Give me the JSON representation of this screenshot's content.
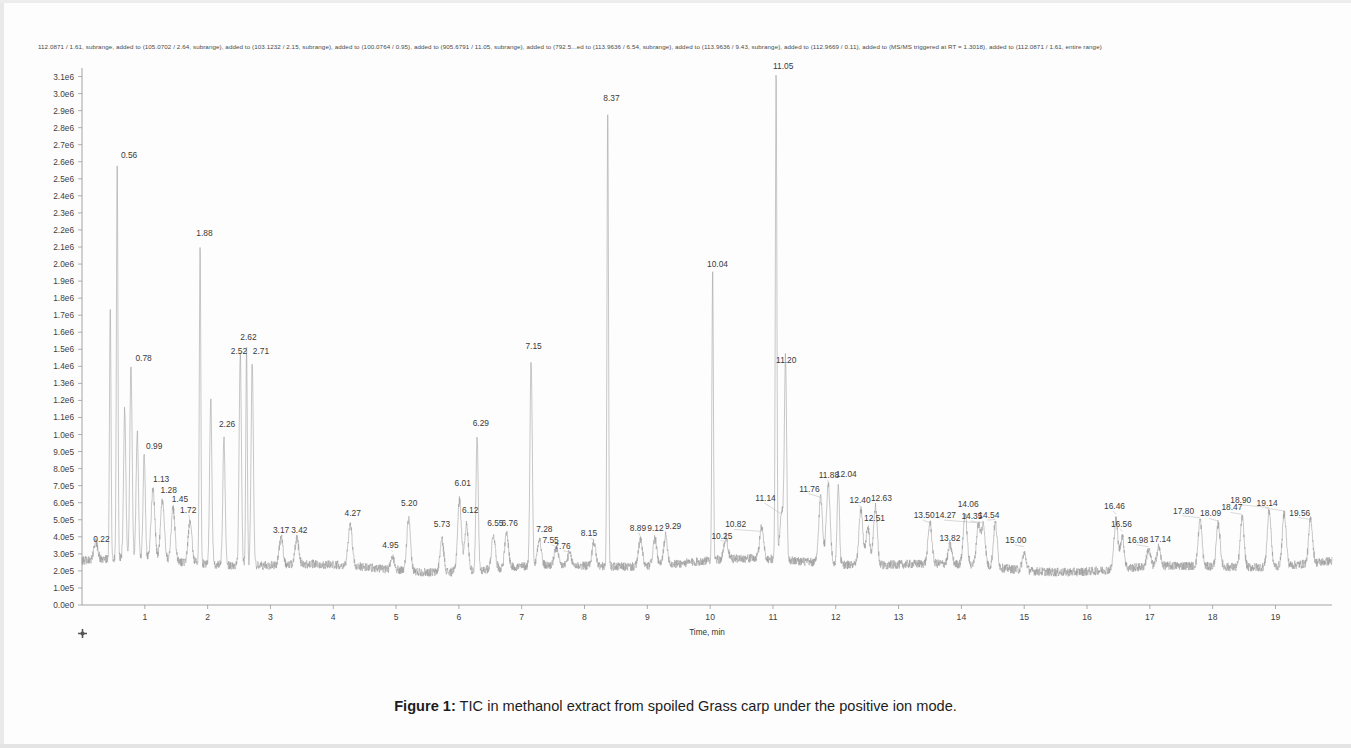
{
  "figure": {
    "header_text": "112.0871 / 1.61, subrange, added to (105.0702 / 2.64, subrange), added to (103.1232 / 2.15, subrange), added to (100.0764 / 0.95), added to (905.6791 / 11.05, subrange), added to (792.5...ed to (113.9636 / 6.54, subrange), added to (113.9636 / 9.43, subrange), added to (112.9669 / 0.11), added to (MS/MS triggered at RT = 1.3018), added to (112.0871 / 1.61, entire range)",
    "caption_label": "Figure 1:",
    "caption_text": " TIC in methanol extract from spoiled Grass carp under the positive ion mode.",
    "trace_color": "#9b9b9b",
    "axis_color": "#9a9a9a",
    "text_color": "#3a3a3a"
  },
  "chart_data": {
    "type": "line",
    "title": "TIC in methanol extract from spoiled Grass carp under the positive ion mode.",
    "xlabel": "Time, min",
    "ylabel": "Intensity",
    "xlim": [
      0.0,
      19.9
    ],
    "ylim": [
      0.0,
      3150000
    ],
    "grid": false,
    "legend": null,
    "xticks": [
      1,
      2,
      3,
      4,
      5,
      6,
      7,
      8,
      9,
      10,
      11,
      12,
      13,
      14,
      15,
      16,
      17,
      18,
      19
    ],
    "xtick_labels": [
      "1",
      "2",
      "3",
      "4",
      "5",
      "6",
      "7",
      "8",
      "9",
      "10",
      "11",
      "12",
      "13",
      "14",
      "15",
      "16",
      "17",
      "18",
      "19"
    ],
    "yticks": [
      0,
      100000,
      200000,
      300000,
      400000,
      500000,
      600000,
      700000,
      800000,
      900000,
      1000000,
      1100000,
      1200000,
      1300000,
      1400000,
      1500000,
      1600000,
      1700000,
      1800000,
      1900000,
      2000000,
      2100000,
      2200000,
      2300000,
      2400000,
      2500000,
      2600000,
      2700000,
      2800000,
      2900000,
      3000000,
      3100000
    ],
    "ytick_labels": [
      "0.0e0",
      "1.0e5",
      "2.0e5",
      "3.0e5",
      "4.0e5",
      "5.0e5",
      "6.0e5",
      "7.0e5",
      "8.0e5",
      "9.0e5",
      "1.0e6",
      "1.1e6",
      "1.2e6",
      "1.3e6",
      "1.4e6",
      "1.5e6",
      "1.6e6",
      "1.7e6",
      "1.8e6",
      "1.9e6",
      "2.0e6",
      "2.1e6",
      "2.2e6",
      "2.3e6",
      "2.4e6",
      "2.5e6",
      "2.6e6",
      "2.7e6",
      "2.8e6",
      "2.9e6",
      "3.0e6",
      "3.1e6"
    ],
    "baseline": 230000,
    "peaks": [
      {
        "rt": 0.22,
        "label": "0.22",
        "height": 330000,
        "label_x": 0.18,
        "label_y": 370000,
        "anchor": "start"
      },
      {
        "rt": 0.45,
        "label": null,
        "height": 1720000
      },
      {
        "rt": 0.56,
        "label": "0.56",
        "height": 2560000,
        "label_x": 0.62,
        "label_y": 2620000,
        "anchor": "start"
      },
      {
        "rt": 0.68,
        "label": null,
        "height": 1100000
      },
      {
        "rt": 0.78,
        "label": "0.78",
        "height": 1370000,
        "label_x": 0.85,
        "label_y": 1430000,
        "anchor": "start"
      },
      {
        "rt": 0.88,
        "label": null,
        "height": 980000
      },
      {
        "rt": 0.99,
        "label": "0.99",
        "height": 840000,
        "label_x": 1.02,
        "label_y": 915000,
        "anchor": "start"
      },
      {
        "rt": 1.13,
        "label": "1.13",
        "height": 640000,
        "label_x": 1.13,
        "label_y": 720000,
        "anchor": "start"
      },
      {
        "rt": 1.28,
        "label": "1.28",
        "height": 580000,
        "label_x": 1.25,
        "label_y": 655000,
        "anchor": "start"
      },
      {
        "rt": 1.45,
        "label": "1.45",
        "height": 540000,
        "label_x": 1.43,
        "label_y": 605000,
        "anchor": "start"
      },
      {
        "rt": 1.72,
        "label": "1.72",
        "height": 470000,
        "label_x": 1.56,
        "label_y": 540000,
        "anchor": "start"
      },
      {
        "rt": 1.88,
        "label": "1.88",
        "height": 2110000,
        "label_x": 1.82,
        "label_y": 2165000,
        "anchor": "start"
      },
      {
        "rt": 2.05,
        "label": null,
        "height": 1180000
      },
      {
        "rt": 2.26,
        "label": "2.26",
        "height": 980000,
        "label_x": 2.18,
        "label_y": 1045000,
        "anchor": "start"
      },
      {
        "rt": 2.52,
        "label": "2.52",
        "height": 1470000,
        "label_x": 2.37,
        "label_y": 1475000,
        "anchor": "start"
      },
      {
        "rt": 2.62,
        "label": "2.62",
        "height": 1530000,
        "label_x": 2.52,
        "label_y": 1555000,
        "anchor": "start"
      },
      {
        "rt": 2.71,
        "label": "2.71",
        "height": 1420000,
        "label_x": 2.72,
        "label_y": 1475000,
        "anchor": "start"
      },
      {
        "rt": 3.17,
        "label": "3.17",
        "height": 390000,
        "label_x": 3.04,
        "label_y": 420000,
        "anchor": "start"
      },
      {
        "rt": 3.42,
        "label": "3.42",
        "height": 380000,
        "label_x": 3.33,
        "label_y": 420000,
        "anchor": "start"
      },
      {
        "rt": 4.27,
        "label": "4.27",
        "height": 480000,
        "label_x": 4.18,
        "label_y": 520000,
        "anchor": "start"
      },
      {
        "rt": 4.95,
        "label": "4.95",
        "height": 300000,
        "label_x": 4.78,
        "label_y": 335000,
        "anchor": "start"
      },
      {
        "rt": 5.2,
        "label": "5.20",
        "height": 530000,
        "label_x": 5.08,
        "label_y": 580000,
        "anchor": "start"
      },
      {
        "rt": 5.73,
        "label": "5.73",
        "height": 420000,
        "label_x": 5.6,
        "label_y": 455000,
        "anchor": "start"
      },
      {
        "rt": 6.01,
        "label": "6.01",
        "height": 650000,
        "label_x": 5.93,
        "label_y": 700000,
        "anchor": "start"
      },
      {
        "rt": 6.12,
        "label": "6.12",
        "height": 500000,
        "label_x": 6.05,
        "label_y": 540000,
        "anchor": "start"
      },
      {
        "rt": 6.29,
        "label": "6.29",
        "height": 1000000,
        "label_x": 6.22,
        "label_y": 1050000,
        "anchor": "start"
      },
      {
        "rt": 6.55,
        "label": "6.55",
        "height": 430000,
        "label_x": 6.45,
        "label_y": 465000,
        "anchor": "start"
      },
      {
        "rt": 6.76,
        "label": "6.76",
        "height": 430000,
        "label_x": 6.68,
        "label_y": 465000,
        "anchor": "start"
      },
      {
        "rt": 7.15,
        "label": "7.15",
        "height": 1450000,
        "label_x": 7.06,
        "label_y": 1500000,
        "anchor": "start"
      },
      {
        "rt": 7.28,
        "label": "7.28",
        "height": 390000,
        "label_x": 7.23,
        "label_y": 430000,
        "anchor": "start"
      },
      {
        "rt": 7.55,
        "label": "7.55",
        "height": 330000,
        "label_x": 7.33,
        "label_y": 365000,
        "anchor": "start"
      },
      {
        "rt": 7.76,
        "label": "7.76",
        "height": 300000,
        "label_x": 7.52,
        "label_y": 330000,
        "anchor": "start"
      },
      {
        "rt": 8.15,
        "label": "8.15",
        "height": 370000,
        "label_x": 7.94,
        "label_y": 405000,
        "anchor": "start"
      },
      {
        "rt": 8.37,
        "label": "8.37",
        "height": 2900000,
        "label_x": 8.3,
        "label_y": 2955000,
        "anchor": "start"
      },
      {
        "rt": 8.89,
        "label": "8.89",
        "height": 390000,
        "label_x": 8.72,
        "label_y": 435000,
        "anchor": "start"
      },
      {
        "rt": 9.12,
        "label": "9.12",
        "height": 390000,
        "label_x": 9.0,
        "label_y": 435000,
        "anchor": "start"
      },
      {
        "rt": 9.29,
        "label": "9.29",
        "height": 400000,
        "label_x": 9.28,
        "label_y": 445000,
        "anchor": "start"
      },
      {
        "rt": 10.04,
        "label": "10.04",
        "height": 1930000,
        "label_x": 9.95,
        "label_y": 1980000,
        "anchor": "start"
      },
      {
        "rt": 10.25,
        "label": "10.25",
        "height": 360000,
        "label_x": 10.02,
        "label_y": 390000,
        "anchor": "start"
      },
      {
        "rt": 10.82,
        "label": "10.82",
        "height": 420000,
        "label_x": 10.24,
        "label_y": 455000,
        "anchor": "start"
      },
      {
        "rt": 11.05,
        "label": "11.05",
        "height": 3100000,
        "label_x": 11.0,
        "label_y": 3145000,
        "anchor": "start"
      },
      {
        "rt": 11.14,
        "label": "11.14",
        "height": 520000,
        "label_x": 10.72,
        "label_y": 610000,
        "anchor": "start"
      },
      {
        "rt": 11.2,
        "label": "11.20",
        "height": 1380000,
        "label_x": 11.05,
        "label_y": 1420000,
        "anchor": "start"
      },
      {
        "rt": 11.76,
        "label": "11.76",
        "height": 620000,
        "label_x": 11.42,
        "label_y": 665000,
        "anchor": "start"
      },
      {
        "rt": 11.88,
        "label": "11.88",
        "height": 700000,
        "label_x": 11.73,
        "label_y": 745000,
        "anchor": "start"
      },
      {
        "rt": 12.04,
        "label": "12.04",
        "height": 710000,
        "label_x": 12.0,
        "label_y": 750000,
        "anchor": "start"
      },
      {
        "rt": 12.4,
        "label": "12.40",
        "height": 560000,
        "label_x": 12.22,
        "label_y": 600000,
        "anchor": "start"
      },
      {
        "rt": 12.51,
        "label": "12.51",
        "height": 450000,
        "label_x": 12.45,
        "label_y": 490000,
        "anchor": "start"
      },
      {
        "rt": 12.63,
        "label": "12.63",
        "height": 570000,
        "label_x": 12.56,
        "label_y": 610000,
        "anchor": "start"
      },
      {
        "rt": 13.5,
        "label": "13.50",
        "height": 470000,
        "label_x": 13.24,
        "label_y": 510000,
        "anchor": "start"
      },
      {
        "rt": 13.82,
        "label": "13.82",
        "height": 340000,
        "label_x": 13.65,
        "label_y": 375000,
        "anchor": "start"
      },
      {
        "rt": 14.06,
        "label": "14.06",
        "height": 530000,
        "label_x": 13.94,
        "label_y": 575000,
        "anchor": "start"
      },
      {
        "rt": 14.27,
        "label": "14.27",
        "height": 470000,
        "label_x": 13.58,
        "label_y": 510000,
        "anchor": "start"
      },
      {
        "rt": 14.35,
        "label": "14.35",
        "height": 470000,
        "label_x": 14.0,
        "label_y": 505000,
        "anchor": "start"
      },
      {
        "rt": 14.54,
        "label": "14.54",
        "height": 490000,
        "label_x": 14.27,
        "label_y": 510000,
        "anchor": "start"
      },
      {
        "rt": 15.0,
        "label": "15.00",
        "height": 330000,
        "label_x": 14.7,
        "label_y": 365000,
        "anchor": "start"
      },
      {
        "rt": 16.46,
        "label": "16.46",
        "height": 520000,
        "label_x": 16.27,
        "label_y": 565000,
        "anchor": "start"
      },
      {
        "rt": 16.56,
        "label": "16.56",
        "height": 420000,
        "label_x": 16.38,
        "label_y": 460000,
        "anchor": "start"
      },
      {
        "rt": 16.98,
        "label": "16.98",
        "height": 330000,
        "label_x": 16.64,
        "label_y": 365000,
        "anchor": "start"
      },
      {
        "rt": 17.14,
        "label": "17.14",
        "height": 340000,
        "label_x": 17.0,
        "label_y": 370000,
        "anchor": "start"
      },
      {
        "rt": 17.8,
        "label": "17.80",
        "height": 500000,
        "label_x": 17.37,
        "label_y": 535000,
        "anchor": "start"
      },
      {
        "rt": 18.09,
        "label": "18.09",
        "height": 480000,
        "label_x": 17.8,
        "label_y": 520000,
        "anchor": "start"
      },
      {
        "rt": 18.47,
        "label": "18.47",
        "height": 520000,
        "label_x": 18.14,
        "label_y": 555000,
        "anchor": "start"
      },
      {
        "rt": 18.9,
        "label": "18.90",
        "height": 560000,
        "label_x": 18.28,
        "label_y": 600000,
        "anchor": "start"
      },
      {
        "rt": 19.14,
        "label": "19.14",
        "height": 540000,
        "label_x": 18.7,
        "label_y": 580000,
        "anchor": "start"
      },
      {
        "rt": 19.56,
        "label": "19.56",
        "height": 490000,
        "label_x": 19.22,
        "label_y": 525000,
        "anchor": "start"
      }
    ]
  }
}
